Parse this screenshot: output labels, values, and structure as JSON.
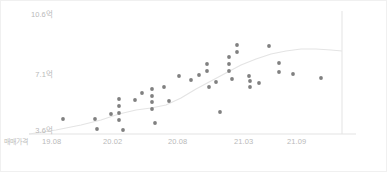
{
  "chart_data": {
    "type": "scatter",
    "title": "",
    "subtitle": "",
    "xlabel": "",
    "ylabel": "",
    "series_label": "매매가격",
    "grid": false,
    "legend_position": "none",
    "y_ticks": [
      {
        "label": "3.6억",
        "value": 3.6,
        "y_px": 130
      },
      {
        "label": "7.1억",
        "value": 7.1,
        "y_px": 74
      },
      {
        "label": "10.6억",
        "value": 10.6,
        "y_px": 14
      }
    ],
    "x_ticks": [
      {
        "label": "19.08",
        "x_px": 55
      },
      {
        "label": "20.02",
        "x_px": 117
      },
      {
        "label": "20.08",
        "x_px": 182
      },
      {
        "label": "21.03",
        "x_px": 248
      },
      {
        "label": "21.09",
        "x_px": 300
      }
    ],
    "ylim": [
      3.2,
      11.0
    ],
    "xlim": [
      "19.06",
      "21.11"
    ],
    "point_color": "#808080",
    "trendline_color": "#e4e4e4",
    "axis_color": "#e3e3e3",
    "points": [
      {
        "x": 62,
        "y": 118
      },
      {
        "x": 94,
        "y": 118
      },
      {
        "x": 96,
        "y": 128
      },
      {
        "x": 110,
        "y": 113
      },
      {
        "x": 118,
        "y": 98
      },
      {
        "x": 118,
        "y": 105
      },
      {
        "x": 118,
        "y": 112
      },
      {
        "x": 118,
        "y": 119
      },
      {
        "x": 122,
        "y": 129
      },
      {
        "x": 134,
        "y": 99
      },
      {
        "x": 141,
        "y": 92
      },
      {
        "x": 151,
        "y": 88
      },
      {
        "x": 151,
        "y": 95
      },
      {
        "x": 151,
        "y": 101
      },
      {
        "x": 151,
        "y": 108
      },
      {
        "x": 154,
        "y": 122
      },
      {
        "x": 163,
        "y": 86
      },
      {
        "x": 168,
        "y": 100
      },
      {
        "x": 178,
        "y": 75
      },
      {
        "x": 190,
        "y": 79
      },
      {
        "x": 198,
        "y": 74
      },
      {
        "x": 206,
        "y": 63
      },
      {
        "x": 206,
        "y": 70
      },
      {
        "x": 208,
        "y": 86
      },
      {
        "x": 215,
        "y": 81
      },
      {
        "x": 219,
        "y": 111
      },
      {
        "x": 228,
        "y": 56
      },
      {
        "x": 228,
        "y": 63
      },
      {
        "x": 228,
        "y": 70
      },
      {
        "x": 231,
        "y": 78
      },
      {
        "x": 236,
        "y": 44
      },
      {
        "x": 236,
        "y": 51
      },
      {
        "x": 248,
        "y": 75
      },
      {
        "x": 249,
        "y": 80
      },
      {
        "x": 249,
        "y": 86
      },
      {
        "x": 258,
        "y": 82
      },
      {
        "x": 268,
        "y": 45
      },
      {
        "x": 278,
        "y": 62
      },
      {
        "x": 278,
        "y": 71
      },
      {
        "x": 292,
        "y": 73
      },
      {
        "x": 320,
        "y": 77
      }
    ],
    "trendline": [
      {
        "x": 28,
        "y": 133
      },
      {
        "x": 55,
        "y": 129
      },
      {
        "x": 80,
        "y": 124
      },
      {
        "x": 100,
        "y": 119
      },
      {
        "x": 118,
        "y": 113
      },
      {
        "x": 135,
        "y": 109
      },
      {
        "x": 150,
        "y": 107
      },
      {
        "x": 165,
        "y": 104
      },
      {
        "x": 180,
        "y": 97
      },
      {
        "x": 195,
        "y": 88
      },
      {
        "x": 210,
        "y": 80
      },
      {
        "x": 225,
        "y": 72
      },
      {
        "x": 240,
        "y": 64
      },
      {
        "x": 255,
        "y": 58
      },
      {
        "x": 270,
        "y": 53
      },
      {
        "x": 285,
        "y": 50
      },
      {
        "x": 300,
        "y": 48
      },
      {
        "x": 315,
        "y": 48
      },
      {
        "x": 330,
        "y": 49
      },
      {
        "x": 341,
        "y": 50
      }
    ],
    "axes": {
      "baseline_y_px": 133,
      "baseline_x_start_px": 28,
      "baseline_x_end_px": 355,
      "vertical_line_x_px": 341,
      "vertical_line_y_top_px": 10,
      "vertical_line_y_bottom_px": 133
    }
  }
}
